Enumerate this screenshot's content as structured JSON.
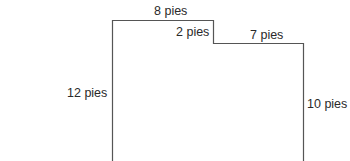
{
  "diagram": {
    "type": "polygon-outline",
    "units": "pies",
    "labels": {
      "top": "8 pies",
      "step": "2 pies",
      "right_top": "7 pies",
      "left": "12 pies",
      "right": "10 pies"
    },
    "stroke_color": "#555555"
  }
}
